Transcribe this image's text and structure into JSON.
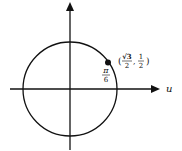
{
  "diagram": {
    "type": "unit-circle",
    "axis_label_x": "u",
    "angle_label": {
      "numerator": "π",
      "denominator": "6"
    },
    "point_label": {
      "open": "(",
      "x": {
        "numerator": "√3",
        "denominator": "2"
      },
      "sep": ",",
      "y": {
        "numerator": "1",
        "denominator": "2"
      },
      "close": ")"
    },
    "colors": {
      "stroke": "#111111",
      "background": "#ffffff"
    }
  }
}
